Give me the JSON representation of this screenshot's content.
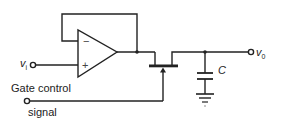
{
  "diagram": {
    "labels": {
      "input": "v",
      "input_sub": "i",
      "gate_line1": "Gate control",
      "gate_line2": "signal",
      "capacitor": "C",
      "output": "v",
      "output_sub": "0",
      "opamp_minus": "−",
      "opamp_plus": "+"
    },
    "components": [
      {
        "type": "op-amp",
        "config": "voltage follower"
      },
      {
        "type": "jfet",
        "role": "analog switch"
      },
      {
        "type": "capacitor",
        "label": "C"
      },
      {
        "type": "ground"
      }
    ],
    "colors": {
      "line": "#222222",
      "background": "#ffffff"
    }
  }
}
